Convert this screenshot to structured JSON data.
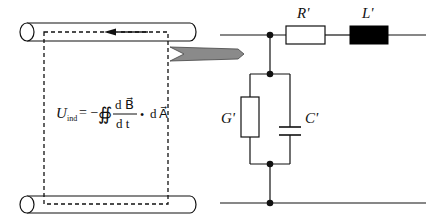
{
  "diagram": {
    "equation": {
      "lhs_symbol": "U",
      "lhs_subscript": "ind",
      "equals": "= −",
      "integral": "∯",
      "numerator": "d B⃗",
      "denominator": "d t",
      "dot": "•",
      "rhs": "d A⃗"
    },
    "components": {
      "series_resistor": {
        "label": "R'"
      },
      "series_inductor": {
        "label": "L'"
      },
      "shunt_conductance": {
        "label": "G'"
      },
      "shunt_capacitor": {
        "label": "C'"
      }
    },
    "colors": {
      "line": "#111111",
      "arrow_fill": "#8a8a8a",
      "inductor_fill": "#000000"
    }
  }
}
